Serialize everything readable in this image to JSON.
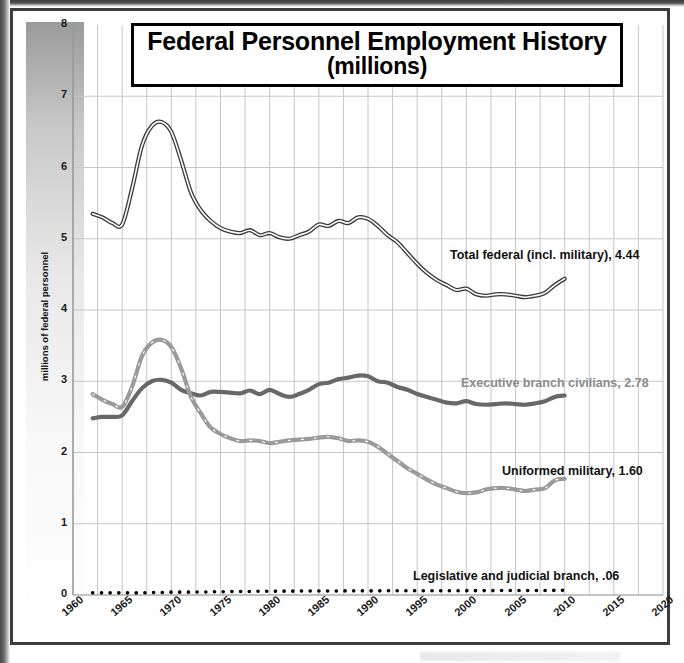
{
  "chart_data": {
    "type": "line",
    "title": "Federal Personnel Employment History",
    "subtitle": "(millions)",
    "xlabel": "",
    "ylabel": "millions of federal personnel",
    "xlim": [
      1960,
      2020
    ],
    "ylim": [
      0,
      8
    ],
    "ytick_labels": [
      "0",
      "1",
      "2",
      "3",
      "4",
      "5",
      "6",
      "7",
      "8"
    ],
    "ytick_values": [
      0,
      1,
      2,
      3,
      4,
      5,
      6,
      7,
      8
    ],
    "xtick_labels": [
      "1960",
      "1965",
      "1970",
      "1975",
      "1980",
      "1985",
      "1990",
      "1995",
      "2000",
      "2005",
      "2010",
      "2015",
      "2020"
    ],
    "xtick_values": [
      1960,
      1965,
      1970,
      1975,
      1980,
      1985,
      1990,
      1995,
      2000,
      2005,
      2010,
      2015,
      2020
    ],
    "grid": true,
    "grid_x_step": 2.5,
    "legend_position": "inline-annotations",
    "x": [
      1962,
      1963,
      1964,
      1965,
      1966,
      1967,
      1968,
      1969,
      1970,
      1971,
      1972,
      1973,
      1974,
      1975,
      1976,
      1977,
      1978,
      1979,
      1980,
      1981,
      1982,
      1983,
      1984,
      1985,
      1986,
      1987,
      1988,
      1989,
      1990,
      1991,
      1992,
      1993,
      1994,
      1995,
      1996,
      1997,
      1998,
      1999,
      2000,
      2001,
      2002,
      2003,
      2004,
      2005,
      2006,
      2007,
      2008,
      2009,
      2010
    ],
    "series": [
      {
        "name": "Total federal (incl. military)",
        "end_value": 4.44,
        "color": "#3a3a3a",
        "style": "outline-double",
        "label": "Total federal (incl. military), 4.44",
        "label_color": "#111111",
        "values": [
          5.35,
          5.3,
          5.22,
          5.2,
          5.7,
          6.3,
          6.58,
          6.64,
          6.5,
          6.1,
          5.65,
          5.4,
          5.25,
          5.15,
          5.1,
          5.08,
          5.12,
          5.05,
          5.08,
          5.02,
          5.0,
          5.05,
          5.1,
          5.2,
          5.18,
          5.25,
          5.22,
          5.3,
          5.28,
          5.18,
          5.05,
          4.95,
          4.8,
          4.65,
          4.52,
          4.42,
          4.35,
          4.28,
          4.3,
          4.22,
          4.2,
          4.22,
          4.22,
          4.2,
          4.18,
          4.2,
          4.24,
          4.35,
          4.44
        ]
      },
      {
        "name": "Executive branch civilians",
        "end_value": 2.78,
        "color": "#686868",
        "style": "solid-thick",
        "label": "Executive branch civilians, 2.78",
        "label_color": "#8c8c8c",
        "values": [
          2.48,
          2.5,
          2.5,
          2.52,
          2.72,
          2.9,
          3.0,
          3.02,
          2.98,
          2.88,
          2.83,
          2.8,
          2.85,
          2.85,
          2.84,
          2.83,
          2.87,
          2.82,
          2.88,
          2.82,
          2.78,
          2.82,
          2.88,
          2.96,
          2.98,
          3.03,
          3.05,
          3.08,
          3.07,
          3.0,
          2.98,
          2.92,
          2.88,
          2.82,
          2.78,
          2.74,
          2.7,
          2.69,
          2.72,
          2.68,
          2.67,
          2.68,
          2.69,
          2.68,
          2.67,
          2.69,
          2.72,
          2.78,
          2.8
        ]
      },
      {
        "name": "Uniformed military",
        "end_value": 1.6,
        "color": "#9a9a9a",
        "style": "dashed-thick",
        "label": "Uniformed military, 1.60",
        "label_color": "#111111",
        "values": [
          2.82,
          2.74,
          2.68,
          2.64,
          2.92,
          3.35,
          3.54,
          3.58,
          3.48,
          3.18,
          2.78,
          2.55,
          2.35,
          2.26,
          2.2,
          2.16,
          2.17,
          2.16,
          2.13,
          2.15,
          2.17,
          2.18,
          2.19,
          2.21,
          2.22,
          2.2,
          2.16,
          2.17,
          2.15,
          2.08,
          1.98,
          1.88,
          1.78,
          1.7,
          1.62,
          1.55,
          1.5,
          1.45,
          1.43,
          1.44,
          1.48,
          1.5,
          1.5,
          1.48,
          1.46,
          1.48,
          1.5,
          1.61,
          1.63
        ]
      },
      {
        "name": "Legislative and judicial branch",
        "end_value": 0.06,
        "color": "#000000",
        "style": "dotted",
        "label": "Legislative and judicial branch, .06",
        "label_color": "#111111",
        "values": [
          0.03,
          0.03,
          0.03,
          0.03,
          0.03,
          0.03,
          0.035,
          0.035,
          0.04,
          0.04,
          0.04,
          0.042,
          0.044,
          0.046,
          0.048,
          0.05,
          0.05,
          0.052,
          0.053,
          0.054,
          0.054,
          0.055,
          0.056,
          0.056,
          0.057,
          0.057,
          0.058,
          0.058,
          0.058,
          0.058,
          0.059,
          0.059,
          0.059,
          0.06,
          0.06,
          0.06,
          0.06,
          0.06,
          0.061,
          0.061,
          0.062,
          0.062,
          0.063,
          0.063,
          0.063,
          0.064,
          0.064,
          0.065,
          0.065
        ]
      }
    ],
    "annotations": [
      {
        "text": "Total federal (incl. military), 4.44",
        "x_px": 437,
        "y_px": 237,
        "color": "#111111"
      },
      {
        "text": "Executive branch civilians, 2.78",
        "x_px": 448,
        "y_px": 365,
        "color": "#8c8c8c"
      },
      {
        "text": "Uniformed military, 1.60",
        "x_px": 489,
        "y_px": 453,
        "color": "#111111"
      },
      {
        "text": "Legislative and judicial branch, .06",
        "x_px": 400,
        "y_px": 558,
        "color": "#111111"
      }
    ]
  }
}
